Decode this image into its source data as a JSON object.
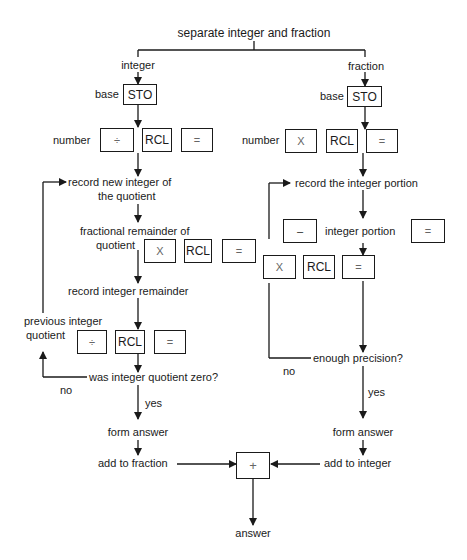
{
  "title": "separate integer and fraction",
  "integer_branch": {
    "label": "integer",
    "base_label": "base",
    "sto_key": "STO",
    "number_label": "number",
    "number_keys": [
      "÷",
      "RCL",
      "="
    ],
    "record_new_integer": "record new integer of",
    "record_new_integer_line2": "the quotient",
    "fractional_remainder": "fractional remainder of",
    "fractional_remainder_line2": "quotient",
    "remainder_keys": [
      "X",
      "RCL",
      "="
    ],
    "record_integer_remainder": "record integer remainder",
    "previous_integer": "previous integer",
    "previous_integer_line2": "quotient",
    "previous_keys": [
      "÷",
      "RCL",
      "="
    ],
    "decision": "was integer quotient zero?",
    "no_label": "no",
    "yes_label": "yes",
    "form_answer": "form answer",
    "add_to": "add to fraction"
  },
  "fraction_branch": {
    "label": "fraction",
    "base_label": "base",
    "sto_key": "STO",
    "number_label": "number",
    "number_keys": [
      "X",
      "RCL",
      "="
    ],
    "record_integer_portion": "record the integer portion",
    "minus_key": "–",
    "integer_portion_label": "integer portion",
    "equals_key": "=",
    "mult_keys": [
      "X",
      "RCL",
      "="
    ],
    "decision": "enough precision?",
    "no_label": "no",
    "yes_label": "yes",
    "form_answer": "form answer",
    "add_to": "add to integer"
  },
  "combine": {
    "plus_key": "+",
    "answer": "answer"
  }
}
